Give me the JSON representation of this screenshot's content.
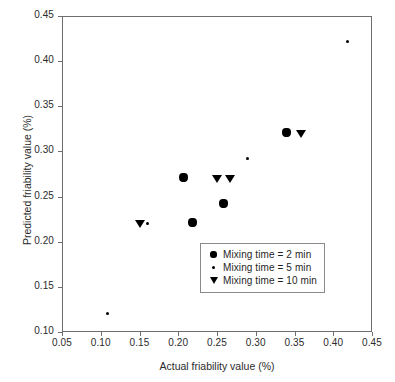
{
  "chart_data": {
    "type": "scatter",
    "title": "",
    "xlabel": "Actual friability value (%)",
    "ylabel": "Predicted friability value (%)",
    "xlim": [
      0.05,
      0.45
    ],
    "ylim": [
      0.1,
      0.45
    ],
    "xticks": [
      "0.05",
      "0.10",
      "0.15",
      "0.20",
      "0.25",
      "0.30",
      "0.35",
      "0.40",
      "0.45"
    ],
    "yticks": [
      "0.10",
      "0.15",
      "0.20",
      "0.25",
      "0.30",
      "0.35",
      "0.40",
      "0.45"
    ],
    "xtick_values": [
      0.05,
      0.1,
      0.15,
      0.2,
      0.25,
      0.3,
      0.35,
      0.4,
      0.45
    ],
    "ytick_values": [
      0.1,
      0.15,
      0.2,
      0.25,
      0.3,
      0.35,
      0.4,
      0.45
    ],
    "grid": false,
    "legend_position": "inside-lower-right",
    "marker_color": "#000000",
    "frame_color": "#6e6e6e",
    "series": [
      {
        "name": "Mixing time = 2 min",
        "marker": "diamond",
        "points": [
          {
            "x": 0.207,
            "y": 0.271
          },
          {
            "x": 0.218,
            "y": 0.221
          },
          {
            "x": 0.258,
            "y": 0.242
          },
          {
            "x": 0.34,
            "y": 0.321
          }
        ]
      },
      {
        "name": "Mixing time = 5 min",
        "marker": "dot",
        "points": [
          {
            "x": 0.109,
            "y": 0.12
          },
          {
            "x": 0.16,
            "y": 0.22
          },
          {
            "x": 0.289,
            "y": 0.292
          },
          {
            "x": 0.419,
            "y": 0.422
          }
        ]
      },
      {
        "name": "Mixing time = 10 min",
        "marker": "triangle-down",
        "points": [
          {
            "x": 0.15,
            "y": 0.22
          },
          {
            "x": 0.25,
            "y": 0.27
          },
          {
            "x": 0.267,
            "y": 0.27
          },
          {
            "x": 0.358,
            "y": 0.32
          }
        ]
      }
    ]
  },
  "legend": {
    "items": [
      {
        "label": "Mixing time = 2 min",
        "marker": "diamond"
      },
      {
        "label": "Mixing time = 5 min",
        "marker": "dot"
      },
      {
        "label": "Mixing time = 10 min",
        "marker": "triangle-down"
      }
    ]
  }
}
